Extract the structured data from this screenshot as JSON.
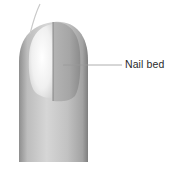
{
  "diagram": {
    "labels": [
      {
        "text": "Nail bed",
        "points_to": "exposed nail bed"
      }
    ],
    "colors": {
      "background": "#ffffff",
      "skin_light": "#e6e6e6",
      "skin_mid": "#bdbdbd",
      "skin_dark": "#8f8f8f",
      "nail_plate": "#f4f4f4",
      "nail_bed": "#a8a8a8",
      "leader_line": "#9a9a9a",
      "label_text": "#2a2a2a"
    }
  }
}
